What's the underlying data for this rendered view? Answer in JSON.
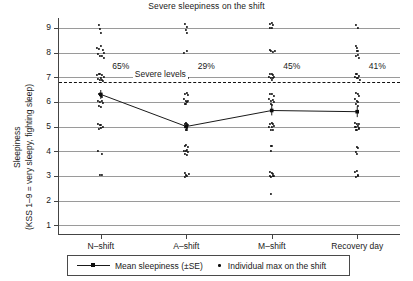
{
  "chart_data": {
    "type": "scatter",
    "title": "Severe sleepiness on the shift",
    "xlabel": "",
    "ylabel_line1": "Sleepiness",
    "ylabel_line2": "(KSS 1–9 = very sleepy, fighting sleep)",
    "categories": [
      "N–shift",
      "A–shift",
      "M–shift",
      "Recovery day"
    ],
    "ylim": [
      0.6,
      9.4
    ],
    "yticks": [
      1,
      2,
      3,
      4,
      5,
      6,
      7,
      8,
      9
    ],
    "grid": "horizontal",
    "legend_position": "below-axes",
    "threshold": {
      "value": 6.8,
      "label": "Severe levels",
      "style": "dashed"
    },
    "annotations": [
      {
        "category": "N–shift",
        "text": "65%",
        "y": 7.45
      },
      {
        "category": "A–shift",
        "text": "29%",
        "y": 7.45
      },
      {
        "category": "M–shift",
        "text": "45%",
        "y": 7.45
      },
      {
        "category": "Recovery day",
        "text": "41%",
        "y": 7.45
      }
    ],
    "series": [
      {
        "name": "Mean sleepiness (±SE)",
        "marker": "line-square",
        "values": [
          6.3,
          5.0,
          5.65,
          5.6
        ],
        "errors": [
          0.18,
          0.16,
          0.2,
          0.22
        ]
      },
      {
        "name": "Individual max on the shift",
        "marker": "dot",
        "points": [
          {
            "cat": 0,
            "dx": -1.5,
            "y": 9.12
          },
          {
            "cat": 0,
            "dx": -0.5,
            "y": 8.95
          },
          {
            "cat": 0,
            "dx": 0.5,
            "y": 8.78
          },
          {
            "cat": 0,
            "dx": -3.5,
            "y": 8.2
          },
          {
            "cat": 0,
            "dx": -1.5,
            "y": 8.15
          },
          {
            "cat": 0,
            "dx": 0.0,
            "y": 8.25
          },
          {
            "cat": 0,
            "dx": 1.8,
            "y": 8.1
          },
          {
            "cat": 0,
            "dx": 3.5,
            "y": 8.0
          },
          {
            "cat": 0,
            "dx": -2.5,
            "y": 7.95
          },
          {
            "cat": 0,
            "dx": -0.8,
            "y": 7.88
          },
          {
            "cat": 0,
            "dx": 1.2,
            "y": 7.85
          },
          {
            "cat": 0,
            "dx": 2.8,
            "y": 7.78
          },
          {
            "cat": 0,
            "dx": -4.0,
            "y": 7.1
          },
          {
            "cat": 0,
            "dx": -2.2,
            "y": 7.12
          },
          {
            "cat": 0,
            "dx": -0.5,
            "y": 7.15
          },
          {
            "cat": 0,
            "dx": 1.5,
            "y": 7.08
          },
          {
            "cat": 0,
            "dx": 3.2,
            "y": 7.0
          },
          {
            "cat": 0,
            "dx": -3.0,
            "y": 6.92
          },
          {
            "cat": 0,
            "dx": -1.0,
            "y": 6.88
          },
          {
            "cat": 0,
            "dx": 1.0,
            "y": 6.9
          },
          {
            "cat": 0,
            "dx": 2.6,
            "y": 6.85
          },
          {
            "cat": 0,
            "dx": -0.3,
            "y": 6.98
          },
          {
            "cat": 0,
            "dx": -2.0,
            "y": 6.3
          },
          {
            "cat": 0,
            "dx": -0.2,
            "y": 6.25
          },
          {
            "cat": 0,
            "dx": 1.5,
            "y": 6.18
          },
          {
            "cat": 0,
            "dx": -3.2,
            "y": 6.05
          },
          {
            "cat": 0,
            "dx": -1.2,
            "y": 6.0
          },
          {
            "cat": 0,
            "dx": 0.8,
            "y": 6.05
          },
          {
            "cat": 0,
            "dx": 2.5,
            "y": 5.95
          },
          {
            "cat": 0,
            "dx": -2.2,
            "y": 5.85
          },
          {
            "cat": 0,
            "dx": 0.2,
            "y": 5.8
          },
          {
            "cat": 0,
            "dx": -2.8,
            "y": 5.1
          },
          {
            "cat": 0,
            "dx": -1.0,
            "y": 5.05
          },
          {
            "cat": 0,
            "dx": 0.5,
            "y": 5.08
          },
          {
            "cat": 0,
            "dx": 2.0,
            "y": 5.0
          },
          {
            "cat": 0,
            "dx": -1.8,
            "y": 4.92
          },
          {
            "cat": 0,
            "dx": 0.0,
            "y": 4.95
          },
          {
            "cat": 0,
            "dx": -2.5,
            "y": 4.02
          },
          {
            "cat": 0,
            "dx": 1.0,
            "y": 3.88
          },
          {
            "cat": 0,
            "dx": -1.0,
            "y": 3.05
          },
          {
            "cat": 0,
            "dx": 0.8,
            "y": 3.02
          },
          {
            "cat": 1,
            "dx": -1.0,
            "y": 9.15
          },
          {
            "cat": 1,
            "dx": 0.5,
            "y": 9.05
          },
          {
            "cat": 1,
            "dx": -0.2,
            "y": 8.9
          },
          {
            "cat": 1,
            "dx": 0.6,
            "y": 8.8
          },
          {
            "cat": 1,
            "dx": -2.5,
            "y": 8.0
          },
          {
            "cat": 1,
            "dx": 0.5,
            "y": 8.05
          },
          {
            "cat": 1,
            "dx": -1.0,
            "y": 7.0
          },
          {
            "cat": 1,
            "dx": 0.6,
            "y": 6.98
          },
          {
            "cat": 1,
            "dx": 1.8,
            "y": 6.95
          },
          {
            "cat": 1,
            "dx": -1.2,
            "y": 6.3
          },
          {
            "cat": 1,
            "dx": 0.5,
            "y": 6.35
          },
          {
            "cat": 1,
            "dx": 1.8,
            "y": 6.28
          },
          {
            "cat": 1,
            "dx": -2.5,
            "y": 6.1
          },
          {
            "cat": 1,
            "dx": -0.8,
            "y": 6.05
          },
          {
            "cat": 1,
            "dx": 0.8,
            "y": 6.0
          },
          {
            "cat": 1,
            "dx": 2.2,
            "y": 6.02
          },
          {
            "cat": 1,
            "dx": -1.6,
            "y": 5.92
          },
          {
            "cat": 1,
            "dx": 0.2,
            "y": 5.9
          },
          {
            "cat": 1,
            "dx": -1.8,
            "y": 5.12
          },
          {
            "cat": 1,
            "dx": -0.5,
            "y": 5.15
          },
          {
            "cat": 1,
            "dx": 0.8,
            "y": 5.1
          },
          {
            "cat": 1,
            "dx": 1.8,
            "y": 5.05
          },
          {
            "cat": 1,
            "dx": -1.2,
            "y": 5.0
          },
          {
            "cat": 1,
            "dx": 0.2,
            "y": 4.98
          },
          {
            "cat": 1,
            "dx": 1.2,
            "y": 4.95
          },
          {
            "cat": 1,
            "dx": -0.5,
            "y": 4.88
          },
          {
            "cat": 1,
            "dx": 0.6,
            "y": 4.85
          },
          {
            "cat": 1,
            "dx": -1.5,
            "y": 4.2
          },
          {
            "cat": 1,
            "dx": 0.2,
            "y": 4.25
          },
          {
            "cat": 1,
            "dx": 1.5,
            "y": 4.18
          },
          {
            "cat": 1,
            "dx": -2.2,
            "y": 4.02
          },
          {
            "cat": 1,
            "dx": -0.8,
            "y": 4.0
          },
          {
            "cat": 1,
            "dx": 0.8,
            "y": 4.05
          },
          {
            "cat": 1,
            "dx": 2.0,
            "y": 3.98
          },
          {
            "cat": 1,
            "dx": -1.0,
            "y": 3.88
          },
          {
            "cat": 1,
            "dx": 0.5,
            "y": 3.85
          },
          {
            "cat": 1,
            "dx": -1.8,
            "y": 3.1
          },
          {
            "cat": 1,
            "dx": -0.5,
            "y": 3.05
          },
          {
            "cat": 1,
            "dx": 0.6,
            "y": 3.0
          },
          {
            "cat": 1,
            "dx": 2.5,
            "y": 3.08
          },
          {
            "cat": 1,
            "dx": -1.0,
            "y": 2.95
          },
          {
            "cat": 2,
            "dx": -1.5,
            "y": 9.15
          },
          {
            "cat": 2,
            "dx": -0.2,
            "y": 9.18
          },
          {
            "cat": 2,
            "dx": 1.0,
            "y": 9.1
          },
          {
            "cat": 2,
            "dx": -2.2,
            "y": 9.0
          },
          {
            "cat": 2,
            "dx": 0.5,
            "y": 8.98
          },
          {
            "cat": 2,
            "dx": -2.0,
            "y": 8.1
          },
          {
            "cat": 2,
            "dx": -0.5,
            "y": 8.05
          },
          {
            "cat": 2,
            "dx": 1.5,
            "y": 8.02
          },
          {
            "cat": 2,
            "dx": 3.2,
            "y": 8.05
          },
          {
            "cat": 2,
            "dx": -1.5,
            "y": 7.12
          },
          {
            "cat": 2,
            "dx": 0.0,
            "y": 7.15
          },
          {
            "cat": 2,
            "dx": 1.5,
            "y": 7.1
          },
          {
            "cat": 2,
            "dx": -2.5,
            "y": 7.0
          },
          {
            "cat": 2,
            "dx": -0.8,
            "y": 6.98
          },
          {
            "cat": 2,
            "dx": 0.8,
            "y": 6.95
          },
          {
            "cat": 2,
            "dx": 2.2,
            "y": 7.0
          },
          {
            "cat": 2,
            "dx": -0.2,
            "y": 6.88
          },
          {
            "cat": 2,
            "dx": -1.5,
            "y": 6.32
          },
          {
            "cat": 2,
            "dx": 0.2,
            "y": 6.3
          },
          {
            "cat": 2,
            "dx": 1.8,
            "y": 6.25
          },
          {
            "cat": 2,
            "dx": -2.5,
            "y": 6.1
          },
          {
            "cat": 2,
            "dx": -0.8,
            "y": 6.05
          },
          {
            "cat": 2,
            "dx": 1.0,
            "y": 6.08
          },
          {
            "cat": 2,
            "dx": 2.5,
            "y": 6.0
          },
          {
            "cat": 2,
            "dx": -1.2,
            "y": 5.92
          },
          {
            "cat": 2,
            "dx": 0.5,
            "y": 5.88
          },
          {
            "cat": 2,
            "dx": -1.8,
            "y": 5.12
          },
          {
            "cat": 2,
            "dx": -0.2,
            "y": 5.15
          },
          {
            "cat": 2,
            "dx": 1.5,
            "y": 5.1
          },
          {
            "cat": 2,
            "dx": -2.5,
            "y": 5.0
          },
          {
            "cat": 2,
            "dx": 0.5,
            "y": 4.98
          },
          {
            "cat": 2,
            "dx": 2.0,
            "y": 5.02
          },
          {
            "cat": 2,
            "dx": -1.0,
            "y": 4.88
          },
          {
            "cat": 2,
            "dx": 0.8,
            "y": 4.85
          },
          {
            "cat": 2,
            "dx": -0.8,
            "y": 4.22
          },
          {
            "cat": 2,
            "dx": 0.5,
            "y": 4.2
          },
          {
            "cat": 2,
            "dx": -0.5,
            "y": 4.0
          },
          {
            "cat": 2,
            "dx": -1.5,
            "y": 3.15
          },
          {
            "cat": 2,
            "dx": 0.0,
            "y": 3.1
          },
          {
            "cat": 2,
            "dx": 1.5,
            "y": 3.08
          },
          {
            "cat": 2,
            "dx": -2.2,
            "y": 3.0
          },
          {
            "cat": 2,
            "dx": -0.8,
            "y": 2.95
          },
          {
            "cat": 2,
            "dx": 0.8,
            "y": 2.98
          },
          {
            "cat": 2,
            "dx": 2.2,
            "y": 3.0
          },
          {
            "cat": 2,
            "dx": -1.0,
            "y": 2.25
          },
          {
            "cat": 3,
            "dx": -0.8,
            "y": 9.12
          },
          {
            "cat": 3,
            "dx": 0.8,
            "y": 9.0
          },
          {
            "cat": 3,
            "dx": -1.5,
            "y": 8.25
          },
          {
            "cat": 3,
            "dx": 0.2,
            "y": 8.2
          },
          {
            "cat": 3,
            "dx": -0.5,
            "y": 8.05
          },
          {
            "cat": 3,
            "dx": 1.2,
            "y": 8.08
          },
          {
            "cat": 3,
            "dx": 0.5,
            "y": 7.9
          },
          {
            "cat": 3,
            "dx": -0.8,
            "y": 7.85
          },
          {
            "cat": 3,
            "dx": 1.8,
            "y": 7.8
          },
          {
            "cat": 3,
            "dx": -1.5,
            "y": 7.15
          },
          {
            "cat": 3,
            "dx": 0.2,
            "y": 7.12
          },
          {
            "cat": 3,
            "dx": 1.8,
            "y": 7.05
          },
          {
            "cat": 3,
            "dx": -2.0,
            "y": 7.0
          },
          {
            "cat": 3,
            "dx": -0.5,
            "y": 6.95
          },
          {
            "cat": 3,
            "dx": 1.0,
            "y": 6.98
          },
          {
            "cat": 3,
            "dx": 2.5,
            "y": 6.9
          },
          {
            "cat": 3,
            "dx": -1.2,
            "y": 6.35
          },
          {
            "cat": 3,
            "dx": 0.5,
            "y": 6.3
          },
          {
            "cat": 3,
            "dx": 2.0,
            "y": 6.25
          },
          {
            "cat": 3,
            "dx": -2.0,
            "y": 6.1
          },
          {
            "cat": 3,
            "dx": -0.5,
            "y": 6.05
          },
          {
            "cat": 3,
            "dx": 1.2,
            "y": 6.0
          },
          {
            "cat": 3,
            "dx": -1.0,
            "y": 5.9
          },
          {
            "cat": 3,
            "dx": 0.5,
            "y": 5.85
          },
          {
            "cat": 3,
            "dx": -1.8,
            "y": 5.15
          },
          {
            "cat": 3,
            "dx": -0.2,
            "y": 5.12
          },
          {
            "cat": 3,
            "dx": 1.5,
            "y": 5.1
          },
          {
            "cat": 3,
            "dx": -2.5,
            "y": 5.0
          },
          {
            "cat": 3,
            "dx": -0.8,
            "y": 4.98
          },
          {
            "cat": 3,
            "dx": 0.8,
            "y": 5.02
          },
          {
            "cat": 3,
            "dx": 2.2,
            "y": 4.95
          },
          {
            "cat": 3,
            "dx": -1.5,
            "y": 4.88
          },
          {
            "cat": 3,
            "dx": 0.2,
            "y": 4.85
          },
          {
            "cat": 3,
            "dx": 1.5,
            "y": 4.9
          },
          {
            "cat": 3,
            "dx": -0.5,
            "y": 4.18
          },
          {
            "cat": 3,
            "dx": 0.8,
            "y": 4.15
          },
          {
            "cat": 3,
            "dx": -1.5,
            "y": 3.95
          },
          {
            "cat": 3,
            "dx": 0.0,
            "y": 3.9
          },
          {
            "cat": 3,
            "dx": -1.8,
            "y": 3.15
          },
          {
            "cat": 3,
            "dx": -0.2,
            "y": 3.2
          },
          {
            "cat": 3,
            "dx": 0.8,
            "y": 3.05
          },
          {
            "cat": 3,
            "dx": -1.0,
            "y": 2.95
          },
          {
            "cat": 3,
            "dx": 0.5,
            "y": 2.98
          }
        ]
      }
    ]
  },
  "legend": {
    "entries": [
      {
        "label": "Mean sleepiness (±SE)"
      },
      {
        "label": "Individual max on the shift"
      }
    ]
  },
  "colors": {
    "grid": "#9a9a9a",
    "axis": "#444444",
    "marker": "#0d0d0d",
    "text": "#1a1a1a",
    "background": "#ffffff"
  }
}
